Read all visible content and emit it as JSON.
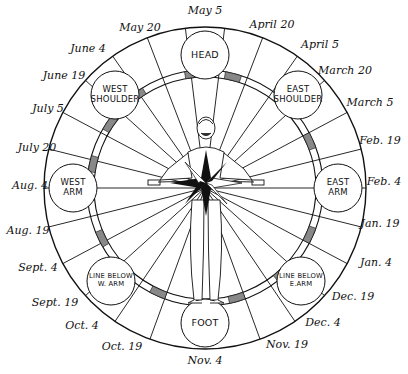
{
  "colors": {
    "ink": "#111111",
    "paper": "#ffffff",
    "hatch": "#888888"
  },
  "geometry": {
    "cx": 205,
    "cy": 188,
    "outer_r": 161,
    "ring_outer_r": 118,
    "ring_inner_r": 111,
    "body_circle_r": 24
  },
  "date_labels": [
    {
      "text": "May 5",
      "x": 205,
      "y": 10
    },
    {
      "text": "May 20",
      "x": 140,
      "y": 27
    },
    {
      "text": "April 20",
      "x": 272,
      "y": 24
    },
    {
      "text": "June 4",
      "x": 88,
      "y": 48
    },
    {
      "text": "April 5",
      "x": 320,
      "y": 44
    },
    {
      "text": "June 19",
      "x": 64,
      "y": 75
    },
    {
      "text": "March 20",
      "x": 345,
      "y": 70
    },
    {
      "text": "July 5",
      "x": 48,
      "y": 108
    },
    {
      "text": "March 5",
      "x": 370,
      "y": 102
    },
    {
      "text": "July 20",
      "x": 37,
      "y": 147
    },
    {
      "text": "Feb. 19",
      "x": 380,
      "y": 140
    },
    {
      "text": "Aug. 4",
      "x": 30,
      "y": 185
    },
    {
      "text": "Feb. 4",
      "x": 384,
      "y": 181
    },
    {
      "text": "Aug. 19",
      "x": 28,
      "y": 230
    },
    {
      "text": "Jan. 19",
      "x": 380,
      "y": 223
    },
    {
      "text": "Sept. 4",
      "x": 38,
      "y": 267
    },
    {
      "text": "Jan. 4",
      "x": 376,
      "y": 262
    },
    {
      "text": "Sept. 19",
      "x": 55,
      "y": 302
    },
    {
      "text": "Dec. 19",
      "x": 353,
      "y": 296
    },
    {
      "text": "Oct. 4",
      "x": 82,
      "y": 325
    },
    {
      "text": "Dec. 4",
      "x": 323,
      "y": 322
    },
    {
      "text": "Oct. 19",
      "x": 122,
      "y": 346
    },
    {
      "text": "Nov. 19",
      "x": 287,
      "y": 344
    },
    {
      "text": "Nov. 4",
      "x": 205,
      "y": 360
    }
  ],
  "body_circles": [
    {
      "text": "HEAD",
      "x": 205,
      "y": 55,
      "size": "big"
    },
    {
      "text": "EAST\nSHOULDER",
      "x": 298,
      "y": 95,
      "size": "normal"
    },
    {
      "text": "EAST\nARM",
      "x": 338,
      "y": 188,
      "size": "normal"
    },
    {
      "text": "LINE BELOW\nE.ARM",
      "x": 301,
      "y": 281,
      "size": "small"
    },
    {
      "text": "FOOT",
      "x": 205,
      "y": 323,
      "size": "big"
    },
    {
      "text": "LINE BELOW\nW. ARM",
      "x": 111,
      "y": 281,
      "size": "small"
    },
    {
      "text": "WEST\nARM",
      "x": 73,
      "y": 188,
      "size": "normal"
    },
    {
      "text": "WEST\nSHOULDER",
      "x": 115,
      "y": 95,
      "size": "normal"
    }
  ],
  "spoke_angles_deg": [
    -97,
    -83,
    -111,
    -69,
    -125,
    -55,
    -138,
    -42,
    -152,
    -28,
    -166,
    -14,
    180,
    0,
    166,
    14,
    152,
    28,
    138,
    42,
    124,
    56,
    110,
    70
  ],
  "hatched_segments_deg": [
    [
      -100,
      -92
    ],
    [
      -130,
      -122
    ],
    [
      -150,
      -142
    ],
    [
      -172,
      -164
    ],
    [
      150,
      158
    ],
    [
      130,
      138
    ],
    [
      110,
      118
    ],
    [
      -80,
      -72
    ],
    [
      -52,
      -44
    ],
    [
      -28,
      -20
    ],
    [
      20,
      28
    ],
    [
      44,
      52
    ],
    [
      70,
      78
    ]
  ]
}
